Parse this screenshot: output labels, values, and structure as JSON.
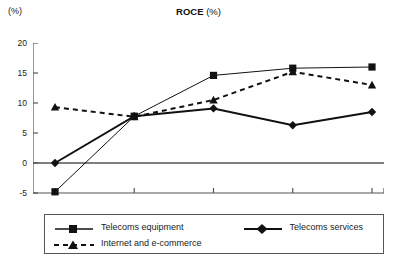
{
  "header": {
    "unit_label": "(%)",
    "title_bold": "ROCE",
    "title_regular": " (%)"
  },
  "legend": {
    "entries": [
      {
        "label": "Telecoms equipment",
        "marker": "square-marker-icon",
        "line": "solid",
        "color": "#111111"
      },
      {
        "label": "Telecoms services",
        "marker": "diamond-marker-icon",
        "line": "solid",
        "color": "#111111"
      },
      {
        "label": "Internet and e-commerce",
        "marker": "triangle-marker-icon",
        "line": "dashed",
        "color": "#111111"
      }
    ]
  },
  "chart_data": {
    "type": "line",
    "title": "ROCE (%)",
    "xlabel": "",
    "ylabel": "(%)",
    "ylim": [
      -5,
      20
    ],
    "yticks": [
      20,
      15,
      10,
      5,
      0,
      -5
    ],
    "ytick_labels": [
      "20",
      "15",
      "10",
      "5",
      "0",
      "-5"
    ],
    "grid": false,
    "legend_position": "bottom",
    "categories": [
      "2002",
      "2003",
      "2004",
      "2005",
      "2006"
    ],
    "x": [
      2002,
      2003,
      2004,
      2005,
      2006
    ],
    "series": [
      {
        "name": "Telecoms equipment",
        "values": [
          -4.8,
          7.8,
          14.6,
          15.8,
          16.0
        ],
        "marker": "square",
        "linestyle": "solid",
        "linewidth": 1,
        "color": "#111111"
      },
      {
        "name": "Telecoms services",
        "values": [
          0.0,
          7.8,
          9.1,
          6.3,
          8.5
        ],
        "marker": "diamond",
        "linestyle": "solid",
        "linewidth": 2,
        "color": "#111111"
      },
      {
        "name": "Internet and e-commerce",
        "values": [
          9.3,
          7.7,
          10.5,
          15.2,
          13.0
        ],
        "marker": "triangle",
        "linestyle": "dashed",
        "linewidth": 2,
        "color": "#111111"
      }
    ]
  }
}
